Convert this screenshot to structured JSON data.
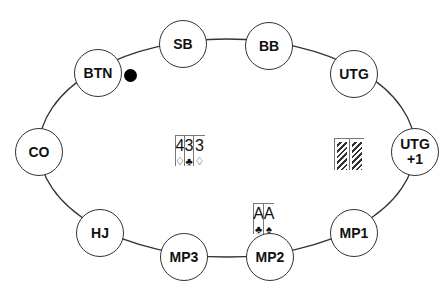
{
  "table": {
    "shape": "ellipse",
    "outline_color": "#333333"
  },
  "seats": [
    {
      "id": "btn",
      "label": "BTN",
      "x": 98,
      "y": 73
    },
    {
      "id": "sb",
      "label": "SB",
      "x": 183,
      "y": 44
    },
    {
      "id": "bb",
      "label": "BB",
      "x": 269,
      "y": 46
    },
    {
      "id": "utg",
      "label": "UTG",
      "x": 354,
      "y": 74
    },
    {
      "id": "utg1",
      "label": "UTG\n+1",
      "x": 415,
      "y": 152
    },
    {
      "id": "mp1",
      "label": "MP1",
      "x": 354,
      "y": 233
    },
    {
      "id": "mp2",
      "label": "MP2",
      "x": 270,
      "y": 257
    },
    {
      "id": "mp3",
      "label": "MP3",
      "x": 184,
      "y": 257
    },
    {
      "id": "hj",
      "label": "HJ",
      "x": 100,
      "y": 233
    },
    {
      "id": "co",
      "label": "CO",
      "x": 39,
      "y": 152
    }
  ],
  "dealer_button": {
    "seat": "BTN",
    "color": "#000000"
  },
  "board": [
    {
      "rank": "4",
      "suit": "♢"
    },
    {
      "rank": "3",
      "suit": "♣"
    },
    {
      "rank": "3",
      "suit": "♢"
    }
  ],
  "hero_cards": {
    "seat": "MP2",
    "cards": [
      {
        "rank": "A",
        "suit": "♣"
      },
      {
        "rank": "A",
        "suit": "♠"
      }
    ]
  },
  "villain_cards": {
    "seat": "UTG+1",
    "face_down": 2
  }
}
